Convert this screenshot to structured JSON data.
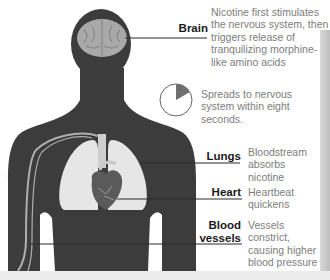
{
  "diagram": {
    "type": "anatomy-callout",
    "colors": {
      "body": "#3c3c3c",
      "brain": "#a9a9a9",
      "lungs": "#e6e6e6",
      "heart": "#5a5a5a",
      "vessel": "#b0b0b0",
      "label_text": "#1a1a1a",
      "desc_text": "#7d7d7d",
      "pie_wedge": "#6e6e6e"
    },
    "callouts": [
      {
        "id": "brain",
        "label": "Brain",
        "description": "Nicotine first stimulates the nervous system, then triggers release of tranquilizing morphine-like amino acids"
      },
      {
        "id": "nervous-system",
        "label": "",
        "description": "Spreads to nervous system within eight seconds.",
        "icon": "clock-pie-icon",
        "pie_fraction": 0.1667
      },
      {
        "id": "lungs",
        "label": "Lungs",
        "description": "Bloodstream absorbs nicotine"
      },
      {
        "id": "heart",
        "label": "Heart",
        "description": "Heartbeat quickens"
      },
      {
        "id": "blood-vessels",
        "label": "Blood vessels",
        "label_lines": [
          "Blood",
          "vessels"
        ],
        "description": "Vessels constrict, causing higher blood pressure"
      }
    ]
  }
}
